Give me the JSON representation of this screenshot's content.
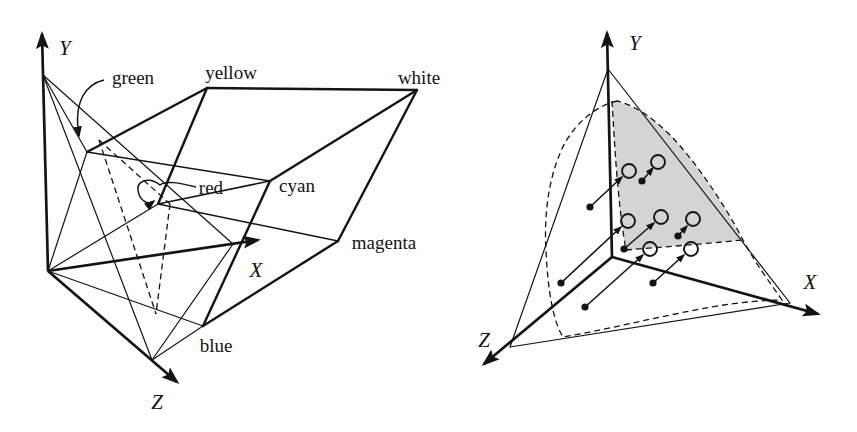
{
  "colors": {
    "ink": "#141414",
    "shade_fill": "#d4d4d4",
    "background": "#ffffff"
  },
  "figure_left": {
    "labels": {
      "y_axis": "Y",
      "x_axis": "X",
      "z_axis": "Z",
      "green": "green",
      "yellow": "yellow",
      "white": "white",
      "red": "red",
      "cyan": "cyan",
      "magenta": "magenta",
      "blue": "blue"
    }
  },
  "figure_right": {
    "labels": {
      "y_axis": "Y",
      "x_axis": "X",
      "z_axis": "Z"
    },
    "projected_point_count": 7
  }
}
